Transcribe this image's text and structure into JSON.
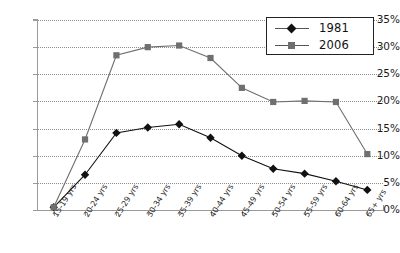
{
  "top_artifact_text": "",
  "legend": {
    "position": "top-right",
    "entries": [
      {
        "label": "1981",
        "marker": "diamond",
        "color": "#111111"
      },
      {
        "label": "2006",
        "marker": "square",
        "color": "#6f6f6f"
      }
    ]
  },
  "axes": {
    "y_ticks": [
      "0%",
      "5%",
      "10%",
      "15%",
      "20%",
      "25%",
      "30%",
      "35%"
    ],
    "x_ticks": [
      "15-19 yrs",
      "20-24 yrs",
      "25-29 yrs",
      "30-34 yrs",
      "35-39 yrs",
      "40-44 yrs",
      "45-49 yrs",
      "50-54 yrs",
      "55-59 yrs",
      "60-64 yrs",
      "65+ yrs"
    ]
  },
  "chart_data": {
    "type": "line",
    "title": "",
    "xlabel": "",
    "ylabel": "",
    "ylim": [
      0,
      35
    ],
    "yticks": [
      0,
      5,
      10,
      15,
      20,
      25,
      30,
      35
    ],
    "ytick_labels": [
      "0%",
      "5%",
      "10%",
      "15%",
      "20%",
      "25%",
      "30%",
      "35%"
    ],
    "grid": "horizontal-dotted",
    "legend_position": "top-right",
    "categories": [
      "15-19 yrs",
      "20-24 yrs",
      "25-29 yrs",
      "30-34 yrs",
      "35-39 yrs",
      "40-44 yrs",
      "45-49 yrs",
      "50-54 yrs",
      "55-59 yrs",
      "60-64 yrs",
      "65+ yrs"
    ],
    "series": [
      {
        "name": "1981",
        "marker": "diamond",
        "color": "#111111",
        "values": [
          0.5,
          6.5,
          14.2,
          15.2,
          15.8,
          13.3,
          10.0,
          7.6,
          6.7,
          5.3,
          3.7
        ]
      },
      {
        "name": "2006",
        "marker": "square",
        "color": "#6f6f6f",
        "values": [
          0.5,
          13.0,
          28.5,
          30.0,
          30.3,
          28.0,
          22.5,
          19.9,
          20.1,
          19.9,
          10.3
        ]
      }
    ]
  }
}
